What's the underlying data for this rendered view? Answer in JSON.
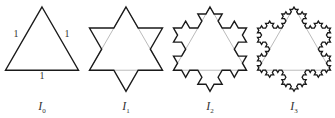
{
  "figure": {
    "colors": {
      "outline": "#1a1a1a",
      "guide": "#bbbbbb",
      "background": "#ffffff"
    },
    "panels": [
      {
        "id": "I0",
        "label_main": "I",
        "label_sub": "0",
        "iterations": 0,
        "apex": [
          42,
          7
        ],
        "side": 73,
        "label_x": 42
      },
      {
        "id": "I1",
        "label_main": "I",
        "label_sub": "1",
        "iterations": 1,
        "apex": [
          126,
          7
        ],
        "side": 73,
        "label_x": 126
      },
      {
        "id": "I2",
        "label_main": "I",
        "label_sub": "2",
        "iterations": 2,
        "apex": [
          210,
          7
        ],
        "side": 73,
        "label_x": 210
      },
      {
        "id": "I3",
        "label_main": "I",
        "label_sub": "3",
        "iterations": 3,
        "apex": [
          294,
          7
        ],
        "side": 73,
        "label_x": 294
      }
    ],
    "side_labels": {
      "left": "1",
      "right": "1",
      "bottom": "1"
    }
  }
}
